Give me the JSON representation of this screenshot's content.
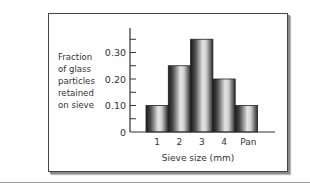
{
  "chart_data": {
    "type": "bar",
    "title": "",
    "categories": [
      "1",
      "2",
      "3",
      "4",
      "Pan"
    ],
    "values": [
      0.1,
      0.25,
      0.35,
      0.2,
      0.1
    ],
    "xlabel": "Sieve size (mm)",
    "ylabel": [
      "Fraction",
      "of glass",
      "particles",
      "retained",
      "on sieve"
    ],
    "yticks": [
      "0",
      "0.10",
      "0.20",
      "0.30"
    ],
    "ylim": [
      0,
      0.38
    ],
    "grid": false,
    "legend": null
  }
}
